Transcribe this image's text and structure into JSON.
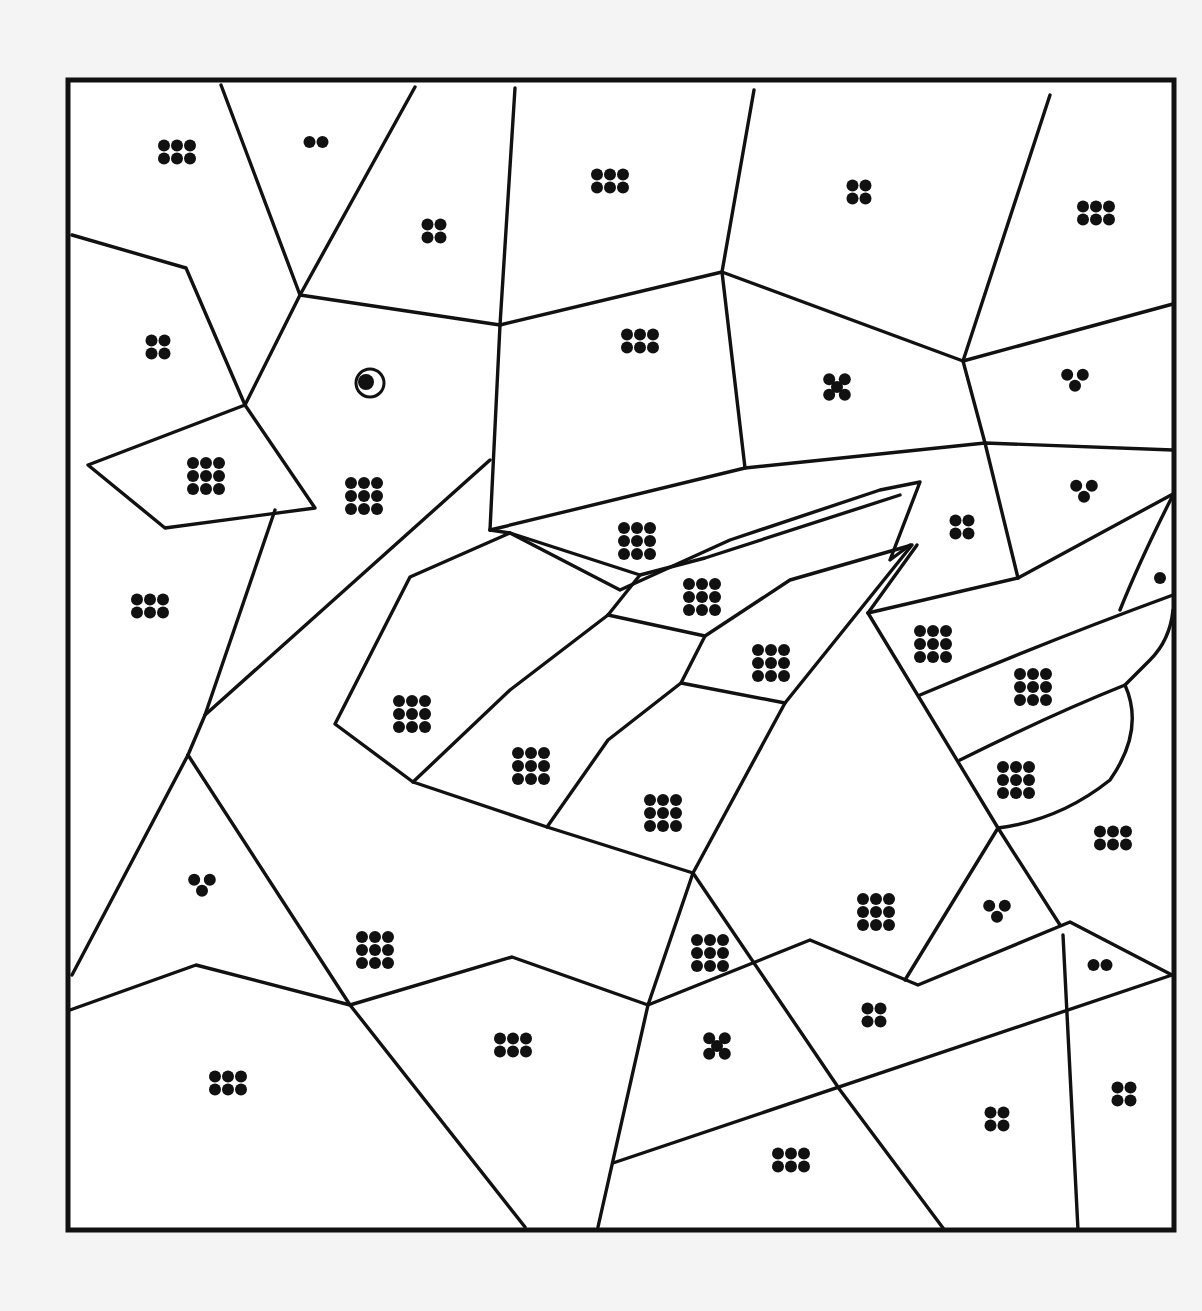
{
  "page": {
    "type": "color-by-dots puzzle",
    "colors": {
      "background": "#f4f4f4",
      "paper": "#ffffff",
      "ink": "#111111"
    }
  },
  "frame": {
    "x": 68,
    "y": 80,
    "width": 1106,
    "height": 1150
  },
  "eye": {
    "cx": 370,
    "cy": 383,
    "r": 14
  },
  "regions": [
    {
      "id": "r01",
      "dots": 6,
      "cx": 177,
      "cy": 152
    },
    {
      "id": "r02",
      "dots": 2,
      "cx": 316,
      "cy": 142
    },
    {
      "id": "r03",
      "dots": 4,
      "cx": 434,
      "cy": 231
    },
    {
      "id": "r04",
      "dots": 6,
      "cx": 610,
      "cy": 181
    },
    {
      "id": "r05",
      "dots": 4,
      "cx": 859,
      "cy": 192
    },
    {
      "id": "r06",
      "dots": 6,
      "cx": 1096,
      "cy": 213
    },
    {
      "id": "r07",
      "dots": 4,
      "cx": 158,
      "cy": 347
    },
    {
      "id": "r08",
      "dots": 6,
      "cx": 640,
      "cy": 341
    },
    {
      "id": "r09",
      "dots": 5,
      "cx": 837,
      "cy": 387
    },
    {
      "id": "r10",
      "dots": 3,
      "cx": 1075,
      "cy": 380
    },
    {
      "id": "r11",
      "dots": 9,
      "cx": 206,
      "cy": 476
    },
    {
      "id": "r12",
      "dots": 9,
      "cx": 364,
      "cy": 496
    },
    {
      "id": "r13",
      "dots": 6,
      "cx": 150,
      "cy": 606
    },
    {
      "id": "r14",
      "dots": 9,
      "cx": 637,
      "cy": 541
    },
    {
      "id": "r15",
      "dots": 4,
      "cx": 962,
      "cy": 527
    },
    {
      "id": "r16",
      "dots": 3,
      "cx": 1084,
      "cy": 491
    },
    {
      "id": "r17",
      "dots": 9,
      "cx": 702,
      "cy": 597
    },
    {
      "id": "r18",
      "dots": 1,
      "cx": 1160,
      "cy": 578
    },
    {
      "id": "r19",
      "dots": 9,
      "cx": 771,
      "cy": 663
    },
    {
      "id": "r20",
      "dots": 9,
      "cx": 933,
      "cy": 644
    },
    {
      "id": "r21",
      "dots": 9,
      "cx": 1033,
      "cy": 687
    },
    {
      "id": "r22",
      "dots": 9,
      "cx": 412,
      "cy": 714
    },
    {
      "id": "r23",
      "dots": 9,
      "cx": 531,
      "cy": 766
    },
    {
      "id": "r24",
      "dots": 9,
      "cx": 663,
      "cy": 813
    },
    {
      "id": "r25",
      "dots": 9,
      "cx": 1016,
      "cy": 780
    },
    {
      "id": "r26",
      "dots": 6,
      "cx": 1113,
      "cy": 838
    },
    {
      "id": "r27",
      "dots": 3,
      "cx": 202,
      "cy": 885
    },
    {
      "id": "r28",
      "dots": 9,
      "cx": 876,
      "cy": 912
    },
    {
      "id": "r29",
      "dots": 3,
      "cx": 997,
      "cy": 911
    },
    {
      "id": "r30",
      "dots": 9,
      "cx": 375,
      "cy": 950
    },
    {
      "id": "r31",
      "dots": 9,
      "cx": 710,
      "cy": 953
    },
    {
      "id": "r32",
      "dots": 2,
      "cx": 1100,
      "cy": 965
    },
    {
      "id": "r33",
      "dots": 4,
      "cx": 874,
      "cy": 1015
    },
    {
      "id": "r34",
      "dots": 5,
      "cx": 717,
      "cy": 1046
    },
    {
      "id": "r35",
      "dots": 6,
      "cx": 513,
      "cy": 1045
    },
    {
      "id": "r36",
      "dots": 6,
      "cx": 228,
      "cy": 1083
    },
    {
      "id": "r37",
      "dots": 4,
      "cx": 1124,
      "cy": 1094
    },
    {
      "id": "r38",
      "dots": 4,
      "cx": 997,
      "cy": 1119
    },
    {
      "id": "r39",
      "dots": 6,
      "cx": 791,
      "cy": 1160
    }
  ],
  "legend": {
    "visible": false
  }
}
